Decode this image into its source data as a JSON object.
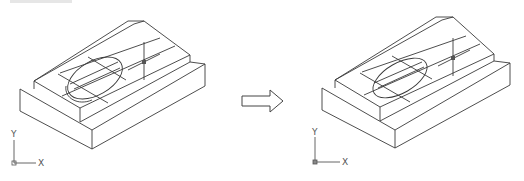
{
  "figure": {
    "before": {
      "label": "before",
      "ucs": {
        "y_label": "Y",
        "x_label": "X"
      }
    },
    "transition_arrow": {
      "direction": "right",
      "style": "hollow"
    },
    "after": {
      "label": "after",
      "ucs": {
        "y_label": "Y",
        "x_label": "X"
      }
    }
  },
  "colors": {
    "line": "#3a3a3a",
    "axis": "#555555",
    "background": "#ffffff"
  }
}
